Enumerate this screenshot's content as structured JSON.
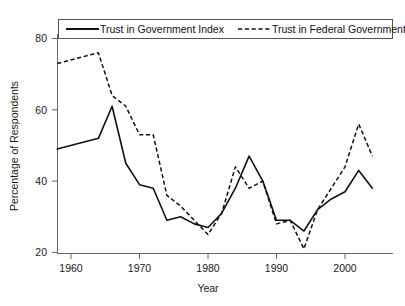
{
  "chart_data": {
    "type": "line",
    "title": "",
    "subtitle": "",
    "xlabel": "Year",
    "ylabel": "Percentage of Respondents",
    "xlim": [
      1957,
      2005
    ],
    "ylim": [
      19,
      81
    ],
    "xticks": [
      1960,
      1970,
      1980,
      1990,
      2000
    ],
    "xtick_labels": [
      "1960",
      "1970",
      "1980",
      "1990",
      "2000"
    ],
    "yticks": [
      20,
      40,
      60,
      80
    ],
    "ytick_labels": [
      "20",
      "40",
      "60",
      "80"
    ],
    "grid": false,
    "legend_position": "top-center-inside",
    "annotations": [],
    "series": [
      {
        "name": "Trust in Government Index",
        "style": "solid",
        "color": "#111111",
        "x": [
          1958,
          1964,
          1966,
          1968,
          1970,
          1972,
          1974,
          1976,
          1978,
          1980,
          1982,
          1984,
          1986,
          1988,
          1990,
          1992,
          1994,
          1996,
          1998,
          2000,
          2002,
          2004
        ],
        "values": [
          49,
          52,
          61,
          45,
          39,
          38,
          29,
          30,
          28,
          27,
          31,
          38,
          47,
          40,
          29,
          29,
          26,
          32,
          35,
          37,
          43,
          38
        ]
      },
      {
        "name": "Trust in Federal Government",
        "style": "dashed",
        "color": "#111111",
        "x": [
          1958,
          1964,
          1966,
          1968,
          1970,
          1972,
          1974,
          1976,
          1978,
          1980,
          1982,
          1984,
          1986,
          1988,
          1990,
          1992,
          1994,
          1996,
          1998,
          2000,
          2002,
          2004
        ],
        "values": [
          73,
          76,
          64,
          61,
          53,
          53,
          36,
          33,
          29,
          25,
          31,
          44,
          38,
          40,
          28,
          29,
          21,
          32,
          38,
          44,
          56,
          47
        ]
      }
    ]
  },
  "legend": {
    "items": [
      {
        "label": "Trust in Government Index",
        "style": "solid"
      },
      {
        "label": "Trust in Federal Government",
        "style": "dashed"
      }
    ]
  },
  "axes": {
    "y_title": "Percentage of Respondents",
    "x_title": "Year",
    "y_tick_0": "20",
    "y_tick_1": "40",
    "y_tick_2": "60",
    "y_tick_3": "80",
    "x_tick_0": "1960",
    "x_tick_1": "1970",
    "x_tick_2": "1980",
    "x_tick_3": "1990",
    "x_tick_4": "2000"
  }
}
